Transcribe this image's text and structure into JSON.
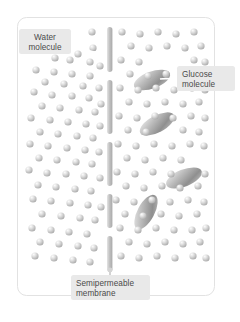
{
  "figure": {
    "kind": "diagram",
    "background_color": "#ffffff",
    "panel": {
      "fill": "#ffffff",
      "border_color": "#e2e2e2",
      "corner_radius": 9
    }
  },
  "labels": {
    "water": {
      "line1": "Water",
      "line2": "molecule",
      "box_color": "#e9e9e9",
      "text_color": "#4a4a4a"
    },
    "glucose": {
      "line1": "Glucose",
      "line2": "molecule",
      "box_color": "#e9e9e9",
      "text_color": "#4a4a4a"
    },
    "membrane": {
      "line1": "Semipermeable",
      "line2": "membrane",
      "box_color": "#e9e9e9",
      "text_color": "#4a4a4a"
    }
  },
  "legend_meaning": {
    "water_molecule": "small grey sphere",
    "glucose_molecule": "large grey tilted ellipse",
    "membrane": "vertical dashed grey bar"
  },
  "chart_data": {
    "type": "diagram",
    "membrane": {
      "orientation": "vertical",
      "x": 110,
      "y_top": 27,
      "y_bottom": 272,
      "color": "#c8c8c8",
      "segment_count": 5,
      "segments": [
        {
          "y1": 27,
          "y2": 72
        },
        {
          "y1": 80,
          "y2": 134
        },
        {
          "y1": 142,
          "y2": 186
        },
        {
          "y1": 194,
          "y2": 228
        },
        {
          "y1": 236,
          "y2": 272
        }
      ]
    },
    "water_molecules": {
      "color": "#c9c9c9",
      "radius": 3.6,
      "count_left": 56,
      "count_right": 60,
      "points_left": [
        [
          92,
          32
        ],
        [
          93,
          48
        ],
        [
          78,
          54
        ],
        [
          55,
          58
        ],
        [
          70,
          60
        ],
        [
          90,
          62
        ],
        [
          36,
          70
        ],
        [
          54,
          72
        ],
        [
          72,
          74
        ],
        [
          90,
          76
        ],
        [
          100,
          66
        ],
        [
          45,
          82
        ],
        [
          64,
          84
        ],
        [
          83,
          86
        ],
        [
          99,
          88
        ],
        [
          34,
          92
        ],
        [
          52,
          95
        ],
        [
          72,
          96
        ],
        [
          89,
          98
        ],
        [
          101,
          104
        ],
        [
          42,
          106
        ],
        [
          60,
          108
        ],
        [
          79,
          110
        ],
        [
          95,
          112
        ],
        [
          31,
          118
        ],
        [
          50,
          120
        ],
        [
          68,
          122
        ],
        [
          86,
          124
        ],
        [
          100,
          126
        ],
        [
          40,
          132
        ],
        [
          58,
          134
        ],
        [
          77,
          136
        ],
        [
          93,
          138
        ],
        [
          30,
          144
        ],
        [
          48,
          146
        ],
        [
          67,
          148
        ],
        [
          85,
          150
        ],
        [
          99,
          152
        ],
        [
          39,
          158
        ],
        [
          57,
          160
        ],
        [
          76,
          162
        ],
        [
          92,
          164
        ],
        [
          29,
          170
        ],
        [
          47,
          173
        ],
        [
          66,
          174
        ],
        [
          84,
          176
        ],
        [
          100,
          178
        ],
        [
          38,
          185
        ],
        [
          56,
          187
        ],
        [
          75,
          189
        ],
        [
          91,
          191
        ],
        [
          33,
          199
        ],
        [
          51,
          201
        ],
        [
          70,
          203
        ],
        [
          88,
          205
        ],
        [
          101,
          207
        ],
        [
          42,
          214
        ],
        [
          61,
          216
        ],
        [
          80,
          218
        ],
        [
          95,
          220
        ],
        [
          32,
          228
        ],
        [
          51,
          230
        ],
        [
          69,
          232
        ],
        [
          87,
          234
        ],
        [
          40,
          242
        ],
        [
          59,
          244
        ],
        [
          78,
          246
        ],
        [
          94,
          248
        ],
        [
          35,
          256
        ],
        [
          54,
          258
        ],
        [
          73,
          260
        ],
        [
          90,
          262
        ]
      ],
      "points_right": [
        [
          122,
          32
        ],
        [
          140,
          34
        ],
        [
          158,
          32
        ],
        [
          176,
          34
        ],
        [
          194,
          32
        ],
        [
          131,
          46
        ],
        [
          149,
          48
        ],
        [
          167,
          46
        ],
        [
          185,
          48
        ],
        [
          201,
          46
        ],
        [
          121,
          60
        ],
        [
          139,
          62
        ],
        [
          194,
          60
        ],
        [
          205,
          62
        ],
        [
          130,
          74
        ],
        [
          148,
          76
        ],
        [
          166,
          74
        ],
        [
          184,
          76
        ],
        [
          200,
          74
        ],
        [
          120,
          88
        ],
        [
          138,
          90
        ],
        [
          156,
          88
        ],
        [
          174,
          90
        ],
        [
          192,
          88
        ],
        [
          205,
          90
        ],
        [
          129,
          102
        ],
        [
          147,
          104
        ],
        [
          165,
          102
        ],
        [
          183,
          104
        ],
        [
          199,
          102
        ],
        [
          119,
          116
        ],
        [
          137,
          118
        ],
        [
          155,
          116
        ],
        [
          173,
          118
        ],
        [
          191,
          116
        ],
        [
          205,
          118
        ],
        [
          128,
          130
        ],
        [
          146,
          132
        ],
        [
          183,
          130
        ],
        [
          199,
          132
        ],
        [
          118,
          144
        ],
        [
          136,
          146
        ],
        [
          154,
          144
        ],
        [
          172,
          146
        ],
        [
          190,
          144
        ],
        [
          204,
          146
        ],
        [
          127,
          158
        ],
        [
          145,
          160
        ],
        [
          163,
          158
        ],
        [
          181,
          160
        ],
        [
          117,
          172
        ],
        [
          135,
          174
        ],
        [
          153,
          172
        ],
        [
          171,
          174
        ],
        [
          205,
          174
        ],
        [
          126,
          186
        ],
        [
          144,
          188
        ],
        [
          162,
          186
        ],
        [
          180,
          188
        ],
        [
          198,
          186
        ],
        [
          116,
          200
        ],
        [
          134,
          202
        ],
        [
          152,
          200
        ],
        [
          170,
          202
        ],
        [
          188,
          200
        ],
        [
          204,
          202
        ],
        [
          125,
          214
        ],
        [
          143,
          216
        ],
        [
          161,
          214
        ],
        [
          179,
          216
        ],
        [
          197,
          214
        ],
        [
          120,
          228
        ],
        [
          138,
          230
        ],
        [
          156,
          228
        ],
        [
          174,
          230
        ],
        [
          192,
          230
        ],
        [
          206,
          228
        ],
        [
          129,
          242
        ],
        [
          147,
          244
        ],
        [
          165,
          242
        ],
        [
          183,
          244
        ],
        [
          200,
          242
        ],
        [
          121,
          256
        ],
        [
          139,
          258
        ],
        [
          157,
          256
        ],
        [
          175,
          258
        ],
        [
          193,
          256
        ],
        [
          206,
          258
        ]
      ]
    },
    "glucose_molecules": {
      "color_light": "#e6e6e6",
      "color_dark": "#8d8d8d",
      "count": 4,
      "side": "right",
      "items": [
        {
          "cx": 152,
          "cy": 80,
          "rx": 19,
          "ry": 8.5,
          "angle": -20
        },
        {
          "cx": 157,
          "cy": 124,
          "rx": 19,
          "ry": 8.5,
          "angle": -28
        },
        {
          "cx": 184,
          "cy": 178,
          "rx": 19,
          "ry": 8.5,
          "angle": -22
        },
        {
          "cx": 146,
          "cy": 212,
          "rx": 19,
          "ry": 8.5,
          "angle": -62
        }
      ]
    },
    "callouts": [
      {
        "label": "water",
        "from": [
          75,
          46
        ],
        "to": [
          97,
          52
        ],
        "color": "#ffffff"
      },
      {
        "label": "glucose",
        "from": [
          176,
          78
        ],
        "to": [
          160,
          79
        ],
        "color": "#ffffff"
      },
      {
        "label": "membrane",
        "from": [
          110,
          270
        ],
        "to": [
          110,
          276
        ],
        "color": "#cfcfcf"
      }
    ]
  }
}
